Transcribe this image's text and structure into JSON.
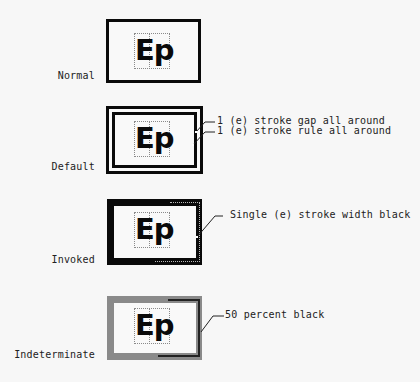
{
  "states": [
    {
      "label": "Normal",
      "glyph": "Ep"
    },
    {
      "label": "Default",
      "glyph": "Ep"
    },
    {
      "label": "Invoked",
      "glyph": "Ep"
    },
    {
      "label": "Indeterminate",
      "glyph": "Ep"
    }
  ],
  "callouts": {
    "default_gap": "1 (e) stroke gap all around",
    "default_rule": "1 (e) stroke rule all around",
    "invoked": "Single (e) stroke width black",
    "indeterminate": "50 percent black"
  },
  "colors": {
    "stroke": "#0a0a0a",
    "indeterminate_stroke": "#8a8a8a",
    "background": "#f7f7f7"
  }
}
